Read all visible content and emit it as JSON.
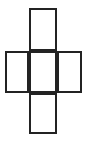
{
  "figure": {
    "shape_name": "plus-polyomino-outline",
    "background_color": "#ffffff",
    "stroke_color": "#232323",
    "fill_color": "#ffffff",
    "stroke_width": 2,
    "canvas": {
      "width": 95,
      "height": 145
    },
    "bounds": {
      "x": 5,
      "y": 8,
      "width": 77,
      "height": 126
    },
    "cell_count": 5,
    "cells": [
      {
        "name": "top-cell",
        "position": "top",
        "x": 29,
        "y": 8,
        "width": 28,
        "height": 43
      },
      {
        "name": "left-cell",
        "position": "middle-left",
        "x": 5,
        "y": 51,
        "width": 24,
        "height": 42
      },
      {
        "name": "center-cell",
        "position": "middle-center",
        "x": 29,
        "y": 51,
        "width": 28,
        "height": 42
      },
      {
        "name": "right-cell",
        "position": "middle-right",
        "x": 57,
        "y": 51,
        "width": 25,
        "height": 42
      },
      {
        "name": "bottom-cell",
        "position": "bottom",
        "x": 29,
        "y": 93,
        "width": 28,
        "height": 41
      }
    ]
  }
}
